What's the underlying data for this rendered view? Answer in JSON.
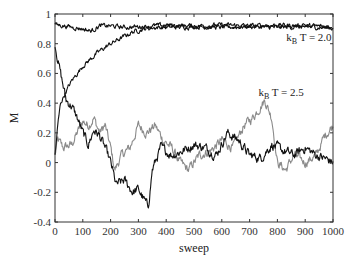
{
  "chart_data": {
    "type": "line",
    "title": "",
    "xlabel": "sweep",
    "ylabel": "M",
    "xlim": [
      0,
      1000
    ],
    "ylim": [
      -0.4,
      1
    ],
    "grid": false,
    "legend": null,
    "x_ticks": [
      0,
      100,
      200,
      300,
      400,
      500,
      600,
      700,
      800,
      900,
      1000
    ],
    "x_tick_labels": [
      "0",
      "100",
      "200",
      "300",
      "400",
      "500",
      "600",
      "700",
      "800",
      "900",
      "1000"
    ],
    "y_ticks": [
      -0.4,
      -0.2,
      0,
      0.2,
      0.4,
      0.6,
      0.8,
      1
    ],
    "y_tick_labels": [
      "-0.4",
      "-0.2",
      "0",
      "0.2",
      "0.4",
      "0.6",
      "0.8",
      "1"
    ],
    "annotations": [
      {
        "text_main": "k",
        "text_sub": "B",
        "text_rest": " T = 2.0",
        "x": 875,
        "y": 0.82
      },
      {
        "text_main": "k",
        "text_sub": "B",
        "text_rest": " T = 2.5",
        "x": 775,
        "y": 0.45
      }
    ],
    "series": [
      {
        "name": "kB T = 2.0 (ordered start)",
        "color": "#111111",
        "noise": 0.012,
        "x": [
          0,
          50,
          100,
          130,
          160,
          200,
          250,
          300,
          400,
          500,
          600,
          700,
          800,
          900,
          1000
        ],
        "y": [
          0.93,
          0.915,
          0.9,
          0.885,
          0.92,
          0.92,
          0.91,
          0.915,
          0.925,
          0.92,
          0.925,
          0.92,
          0.925,
          0.92,
          0.915
        ]
      },
      {
        "name": "kB T = 2.0 (random start)",
        "color": "#111111",
        "noise": 0.012,
        "x": [
          0,
          10,
          20,
          40,
          60,
          80,
          100,
          130,
          160,
          200,
          240,
          280,
          320,
          360,
          400,
          500,
          600,
          700,
          800,
          900,
          1000
        ],
        "y": [
          0.05,
          0.25,
          0.4,
          0.48,
          0.55,
          0.6,
          0.65,
          0.7,
          0.75,
          0.8,
          0.84,
          0.88,
          0.9,
          0.91,
          0.91,
          0.915,
          0.91,
          0.915,
          0.91,
          0.915,
          0.905
        ]
      },
      {
        "name": "kB T = 2.5 (black)",
        "color": "#111111",
        "noise": 0.025,
        "x": [
          0,
          20,
          40,
          60,
          80,
          100,
          120,
          140,
          160,
          180,
          200,
          220,
          250,
          280,
          300,
          320,
          335,
          350,
          380,
          420,
          460,
          500,
          540,
          580,
          620,
          660,
          700,
          740,
          780,
          820,
          860,
          900,
          940,
          980,
          1000
        ],
        "y": [
          0.8,
          0.6,
          0.42,
          0.38,
          0.3,
          0.2,
          0.12,
          0.22,
          0.18,
          0.1,
          0.0,
          -0.15,
          -0.12,
          -0.2,
          -0.18,
          -0.25,
          -0.3,
          -0.05,
          0.1,
          0.05,
          0.08,
          0.12,
          0.1,
          0.05,
          0.2,
          0.15,
          0.05,
          0.03,
          0.12,
          0.08,
          0.05,
          0.1,
          0.05,
          0.02,
          0.0
        ]
      },
      {
        "name": "kB T = 2.5 (gray)",
        "color": "#8a8a8a",
        "noise": 0.025,
        "x": [
          0,
          10,
          30,
          60,
          80,
          100,
          120,
          140,
          160,
          180,
          200,
          215,
          240,
          270,
          300,
          330,
          360,
          390,
          420,
          450,
          480,
          520,
          560,
          600,
          640,
          680,
          710,
          740,
          755,
          780,
          800,
          830,
          860,
          900,
          940,
          970,
          1000
        ],
        "y": [
          0.05,
          0.15,
          0.1,
          0.12,
          0.2,
          0.28,
          0.25,
          0.3,
          0.2,
          0.25,
          0.1,
          -0.05,
          0.05,
          0.1,
          0.25,
          0.2,
          0.25,
          0.15,
          0.1,
          0.0,
          -0.05,
          0.05,
          0.08,
          0.15,
          0.1,
          0.25,
          0.3,
          0.38,
          0.42,
          0.3,
          0.0,
          -0.05,
          0.05,
          0.0,
          0.05,
          0.18,
          0.25
        ]
      }
    ]
  }
}
